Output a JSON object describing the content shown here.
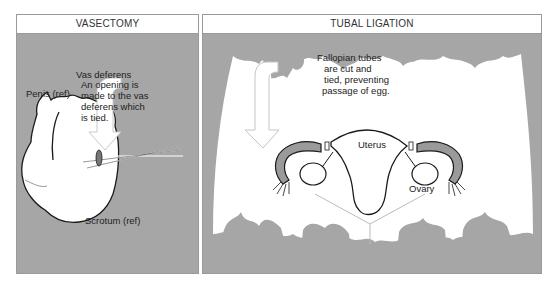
{
  "panels": {
    "vasectomy": {
      "title": "VASECTOMY",
      "labels": {
        "vas_deferens": "Vas deferens",
        "description": [
          "An opening is",
          "made to the vas",
          "deferens which",
          "is tied."
        ],
        "penis": "Penis (ref)",
        "scrotum": "Scrotum (ref)"
      }
    },
    "tubal_ligation": {
      "title": "TUBAL  LIGATION",
      "labels": {
        "description": [
          "Fallopian tubes",
          "are cut and",
          "tied, preventing",
          "passage of egg."
        ],
        "uterus": "Uterus",
        "ovary": "Ovary"
      }
    }
  },
  "colors": {
    "background_gray": "#a6a6a6",
    "tube_gray": "#9a9a9a",
    "outline": "#1a1a1a"
  }
}
